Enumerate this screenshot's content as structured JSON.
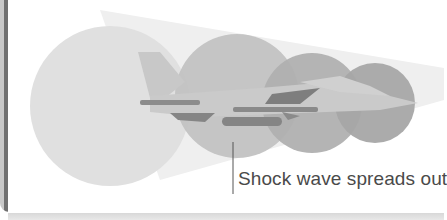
{
  "diagram": {
    "caption": "Shock wave spreads out",
    "elements": {
      "jet": "fighter-jet-silhouette",
      "shock_waves": 4,
      "cone": "shock-cone"
    },
    "colors": {
      "background": "#ffffff",
      "cone": "#ececec",
      "circle_large": "#dedede",
      "circle_mid": "#bdbdbd",
      "circle_small1": "#aeaeae",
      "circle_small2": "#a2a2a2",
      "jet_body": "#c4c4c4",
      "jet_dark": "#8a8a8a",
      "text": "#4a4a4a"
    }
  }
}
